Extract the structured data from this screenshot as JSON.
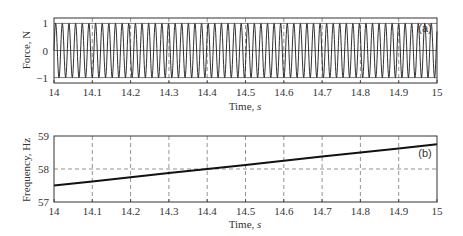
{
  "chart_data": [
    {
      "type": "line",
      "panel_label": "(a)",
      "title": "",
      "xlabel": "Time, s",
      "ylabel": "Force, N",
      "xlim": [
        14,
        15
      ],
      "ylim": [
        -1.2,
        1.2
      ],
      "x_ticks": [
        "14",
        "14.1",
        "14.2",
        "14.3",
        "14.4",
        "14.5",
        "14.6",
        "14.7",
        "14.8",
        "14.9",
        "15"
      ],
      "y_ticks": [
        "1",
        "0",
        "-1"
      ],
      "grid": "vertical dashed at x ticks, horizontal at 0, ±1 lines",
      "series": [
        {
          "name": "Force",
          "description": "Unit-amplitude sinusoid with frequency sweeping from ~57.5 Hz to ~58.75 Hz",
          "amplitude": 1,
          "freq_start_hz": 57.5,
          "freq_end_hz": 58.75
        }
      ]
    },
    {
      "type": "line",
      "panel_label": "(b)",
      "title": "",
      "xlabel": "Time, s",
      "ylabel": "Frequency, Hz",
      "xlim": [
        14,
        15
      ],
      "ylim": [
        57,
        59
      ],
      "x_ticks": [
        "14",
        "14.1",
        "14.2",
        "14.3",
        "14.4",
        "14.5",
        "14.6",
        "14.7",
        "14.8",
        "14.9",
        "15"
      ],
      "y_ticks": [
        "59",
        "58",
        "57"
      ],
      "grid": "dashed",
      "series": [
        {
          "name": "Frequency",
          "x": [
            14,
            14.1,
            14.2,
            14.3,
            14.4,
            14.5,
            14.6,
            14.7,
            14.8,
            14.9,
            15
          ],
          "values": [
            57.5,
            57.62,
            57.75,
            57.88,
            58.0,
            58.12,
            58.25,
            58.38,
            58.5,
            58.62,
            58.75
          ]
        }
      ]
    }
  ]
}
